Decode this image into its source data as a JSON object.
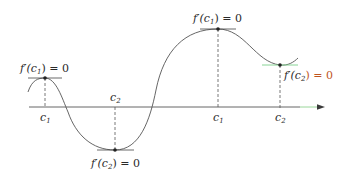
{
  "diagram": {
    "axis": {
      "y": 107,
      "x_start": 29,
      "x_end": 325,
      "color": "#555555",
      "arrow_color": "#3a3a3a",
      "tail_tint": "#8fd18f"
    },
    "curve_color": "#555555",
    "tangent_color": "#444444",
    "tangent_tint": "#7ccf8a",
    "points": [
      {
        "id": "p1",
        "x": 45,
        "y": 78,
        "kind": "max",
        "tick_label": "c",
        "tick_sub": "1",
        "tick_pos": "below",
        "annotation": {
          "f": "f′(c",
          "sub": "1",
          "tail": ") = 0",
          "pos": "above"
        }
      },
      {
        "id": "p2",
        "x": 115,
        "y": 150,
        "kind": "min",
        "tick_label": "c",
        "tick_sub": "2",
        "tick_pos": "above",
        "annotation": {
          "f": "f′(c",
          "sub": "2",
          "tail": ") = 0",
          "pos": "below"
        }
      },
      {
        "id": "p3",
        "x": 218,
        "y": 29,
        "kind": "max",
        "tick_label": "c",
        "tick_sub": "1",
        "tick_pos": "below",
        "annotation": {
          "f": "f′(c",
          "sub": "1",
          "tail": ") = 0",
          "pos": "above"
        }
      },
      {
        "id": "p4",
        "x": 280,
        "y": 65,
        "kind": "min",
        "tick_label": "c",
        "tick_sub": "2",
        "tick_pos": "below",
        "annotation": {
          "f": "f′(c",
          "sub": "2",
          "tail": ") = 0",
          "pos": "right"
        }
      }
    ],
    "annotation_zero_color": "#c0551f"
  }
}
